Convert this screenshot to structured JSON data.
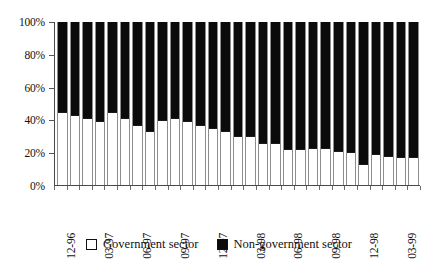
{
  "chart_data": {
    "type": "bar",
    "subtype": "100% stacked column",
    "title": "",
    "xlabel": "",
    "ylabel": "",
    "ylim": [
      0,
      100
    ],
    "ytick_labels": [
      "0%",
      "20%",
      "40%",
      "60%",
      "80%",
      "100%"
    ],
    "ytick_values": [
      0,
      20,
      40,
      60,
      80,
      100
    ],
    "grid": false,
    "legend_position": "bottom",
    "categories": [
      "12-96",
      "01-97",
      "02-97",
      "03-97",
      "04-97",
      "05-97",
      "06-97",
      "07-97",
      "08-97",
      "09-97",
      "10-97",
      "11-97",
      "12-97",
      "01-98",
      "02-98",
      "03-98",
      "04-98",
      "05-98",
      "06-98",
      "07-98",
      "08-98",
      "09-98",
      "10-98",
      "11-98",
      "12-98",
      "01-99",
      "02-99",
      "03-99",
      "04-99"
    ],
    "tick_labels_shown": [
      "12-96",
      "03-97",
      "06-97",
      "09-97",
      "12-97",
      "03-98",
      "06-98",
      "09-98",
      "12-98",
      "03-99"
    ],
    "tick_label_indices": [
      0,
      3,
      6,
      9,
      12,
      15,
      18,
      21,
      24,
      27
    ],
    "series": [
      {
        "name": "Government sector",
        "color": "#ffffff",
        "values": [
          45,
          43,
          41,
          39,
          45,
          41,
          37,
          33,
          40,
          41,
          39,
          37,
          35,
          33,
          30,
          30,
          26,
          26,
          22,
          22,
          23,
          23,
          21,
          20,
          13,
          19,
          18,
          17,
          17
        ]
      },
      {
        "name": "Non-government sector",
        "color": "#000000",
        "values": [
          55,
          57,
          59,
          61,
          55,
          59,
          63,
          67,
          60,
          59,
          61,
          63,
          65,
          67,
          70,
          70,
          74,
          74,
          78,
          78,
          77,
          77,
          79,
          80,
          87,
          81,
          82,
          83,
          83
        ]
      }
    ]
  },
  "legend": {
    "items": [
      {
        "label": "Government sector",
        "swatch": "white-square-icon"
      },
      {
        "label": "Non-government sector",
        "swatch": "black-square-icon"
      }
    ]
  }
}
